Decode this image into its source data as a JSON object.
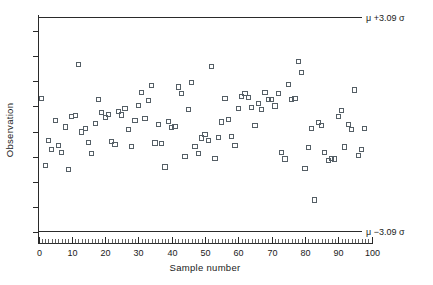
{
  "chart_data": {
    "type": "scatter",
    "title": "",
    "subtitle": "",
    "xlabel": "Sample number",
    "ylabel": "Observation",
    "xlim": [
      0,
      100
    ],
    "ylim": [
      0,
      10
    ],
    "grid": false,
    "legend": "none",
    "x_ticks": [
      0,
      10,
      20,
      30,
      40,
      50,
      60,
      70,
      80,
      90,
      100
    ],
    "x_tick_labels": [
      "0",
      "10",
      "20",
      "30",
      "40",
      "50",
      "60",
      "70",
      "80",
      "90",
      "100"
    ],
    "x_minor_tick_step": 1,
    "y_ticks": [
      0.5,
      1.6,
      2.7,
      3.8,
      4.9,
      6.0,
      7.1,
      8.2,
      9.3
    ],
    "y_tick_labels": [
      "",
      "",
      "",
      "",
      "",
      "",
      "",
      "",
      ""
    ],
    "series": [
      {
        "name": "Observation",
        "marker": "open-square",
        "x": [
          1,
          2,
          3,
          4,
          5,
          6,
          7,
          8,
          9,
          10,
          11,
          12,
          13,
          14,
          15,
          16,
          17,
          18,
          19,
          20,
          21,
          22,
          23,
          24,
          25,
          26,
          27,
          28,
          29,
          30,
          31,
          32,
          33,
          34,
          35,
          36,
          37,
          38,
          39,
          40,
          41,
          42,
          43,
          44,
          45,
          46,
          47,
          48,
          49,
          50,
          51,
          52,
          53,
          54,
          55,
          56,
          57,
          58,
          59,
          60,
          61,
          62,
          63,
          64,
          65,
          66,
          67,
          68,
          69,
          70,
          71,
          72,
          73,
          74,
          75,
          76,
          77,
          78,
          79,
          80,
          81,
          82,
          83,
          84,
          85,
          86,
          87,
          88,
          89,
          90,
          91,
          92,
          93,
          94,
          95,
          96,
          97,
          98
        ],
        "y": [
          6.33,
          3.4,
          4.5,
          4.12,
          5.38,
          4.3,
          4.0,
          5.1,
          3.25,
          5.55,
          5.6,
          7.85,
          4.88,
          5.05,
          4.43,
          3.95,
          5.25,
          6.3,
          5.72,
          5.5,
          5.65,
          4.45,
          4.33,
          5.78,
          5.62,
          5.9,
          5.0,
          4.25,
          5.4,
          6.05,
          6.6,
          5.48,
          6.25,
          6.92,
          4.4,
          5.22,
          4.38,
          3.35,
          5.35,
          5.07,
          5.12,
          6.85,
          6.55,
          3.8,
          5.85,
          7.05,
          4.25,
          3.95,
          4.62,
          4.78,
          4.5,
          7.75,
          3.72,
          4.65,
          5.32,
          6.35,
          5.42,
          4.7,
          4.28,
          5.9,
          6.45,
          6.55,
          6.4,
          5.95,
          5.15,
          6.12,
          5.85,
          6.62,
          6.3,
          6.3,
          6.02,
          6.55,
          3.98,
          3.7,
          6.95,
          6.3,
          6.35,
          7.95,
          7.5,
          3.28,
          4.2,
          5.05,
          1.9,
          5.28,
          5.15,
          4.0,
          3.62,
          3.72,
          3.7,
          5.55,
          5.82,
          4.22,
          5.2,
          4.98,
          6.72,
          3.85,
          4.12,
          5.05
        ]
      }
    ],
    "control_limits": [
      {
        "name": "upper-control-limit",
        "label": "μ +3.09 σ",
        "value": 9.9
      },
      {
        "name": "lower-control-limit",
        "label": "μ −3.09 σ",
        "value": 0.55
      }
    ],
    "colors": {
      "axis": "#2a2a2a",
      "marker": "#555f66",
      "limit_line": "#2a2a2a",
      "text": "#1a1a1a",
      "background": "#ffffff"
    }
  }
}
